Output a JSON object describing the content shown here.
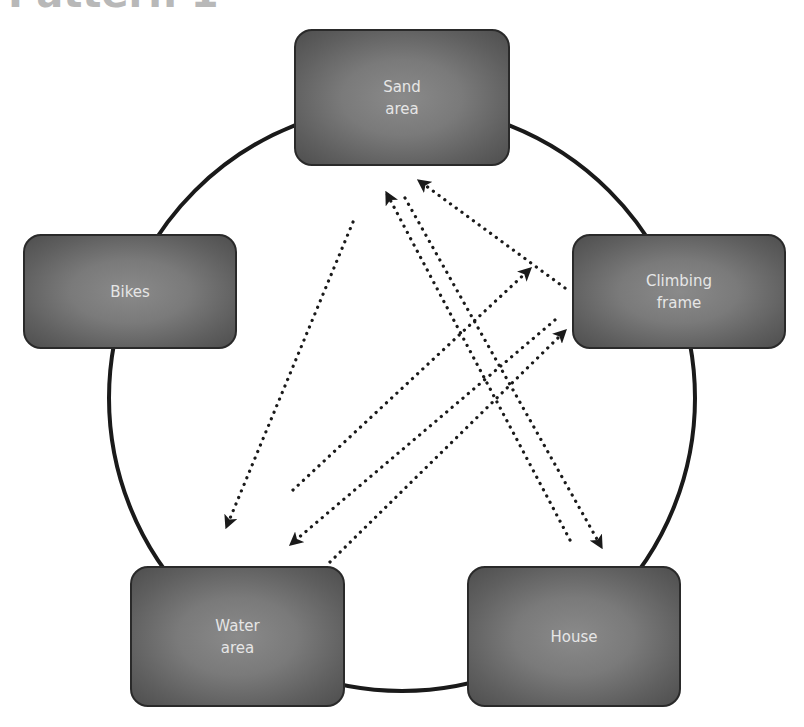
{
  "title": "Pattern 1",
  "colors": {
    "node_fill": "#6e6e6e",
    "node_border": "#2a2a2a",
    "node_text": "#e6e6e6",
    "circle_stroke": "#1a1a1a",
    "arrow": "#1a1a1a"
  },
  "nodes": [
    {
      "id": "sand",
      "label": "Sand\narea"
    },
    {
      "id": "bikes",
      "label": "Bikes"
    },
    {
      "id": "climbing",
      "label": "Climbing\nframe"
    },
    {
      "id": "water",
      "label": "Water\narea"
    },
    {
      "id": "house",
      "label": "House"
    }
  ],
  "edges": [
    {
      "from": "Sand area",
      "to": "Water area",
      "style": "dotted-arrow"
    },
    {
      "from": "Water area",
      "to": "Climbing frame",
      "style": "dotted-arrow"
    },
    {
      "from": "Climbing frame",
      "to": "Water area",
      "style": "dotted-arrow"
    },
    {
      "from": "Water area",
      "to": "Climbing frame",
      "style": "dotted-arrow"
    },
    {
      "from": "House",
      "to": "Sand area",
      "style": "dotted-arrow"
    },
    {
      "from": "Sand area",
      "to": "House",
      "style": "dotted-arrow"
    },
    {
      "from": "Climbing frame",
      "to": "Sand area",
      "style": "dotted-arrow"
    }
  ]
}
